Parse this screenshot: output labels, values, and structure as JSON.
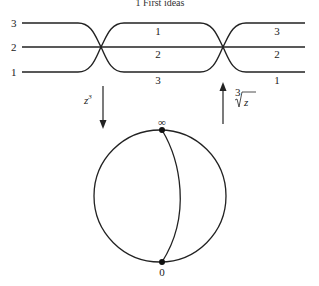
{
  "header": {
    "text": "1 First ideas"
  },
  "sheets_diagram": {
    "left_labels": [
      "3",
      "2",
      "1"
    ],
    "middle_labels": [
      "1",
      "2",
      "3"
    ],
    "right_labels": [
      "3",
      "2",
      "1"
    ]
  },
  "arrows": {
    "down_label": "z",
    "down_exponent": "3",
    "up_root_index": "3",
    "up_radicand": "z"
  },
  "sphere": {
    "top_label": "∞",
    "bottom_label": "0"
  },
  "colors": {
    "stroke": "#222222",
    "background": "#ffffff"
  }
}
